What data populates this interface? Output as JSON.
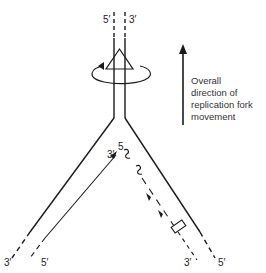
{
  "diagram": {
    "type": "replication-fork",
    "colors": {
      "line": "#1a1a1a",
      "background": "#ffffff"
    },
    "labels": {
      "top_left_strand": "5′",
      "top_right_strand": "3′",
      "leading_primer_5": "5",
      "leading_strand_3": "3′",
      "bottom_left_3": "3′",
      "bottom_left_5": "5′",
      "bottom_right_3": "3′",
      "bottom_right_5": "5′"
    },
    "caption": {
      "line1": "Overall",
      "line2": "direction of",
      "line3": "replication fork",
      "line4": "movement"
    },
    "icons": [
      "helicase-triangle-icon",
      "rotation-arrow-icon",
      "up-arrow-icon",
      "rna-primer-squiggle-icon",
      "ligase-box-icon"
    ]
  }
}
